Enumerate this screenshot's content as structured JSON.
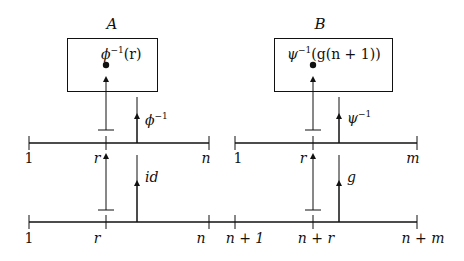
{
  "diagram": {
    "boxes": [
      {
        "id": "A",
        "title": "A",
        "content": "ϕ⁻¹(r)",
        "content_base": "ϕ",
        "content_sup": "−1",
        "content_rest": "(r)"
      },
      {
        "id": "B",
        "title": "B",
        "content": "ψ⁻¹(g(n+1))",
        "content_base": "ψ",
        "content_sup": "−1",
        "content_rest": "(g(n + 1))"
      }
    ],
    "middle_left_line": {
      "ticks": [
        "1",
        "r",
        "n"
      ]
    },
    "middle_right_line": {
      "ticks": [
        "1",
        "r",
        "m"
      ]
    },
    "bottom_line": {
      "ticks": [
        "1",
        "r",
        "n",
        "n + 1",
        "n + r",
        "n + m"
      ]
    },
    "arrows": {
      "phi_inv": {
        "base": "ϕ",
        "sup": "−1"
      },
      "psi_inv": {
        "base": "ψ",
        "sup": "−1"
      },
      "id": "id",
      "g": "g"
    }
  },
  "colors": {
    "stroke": "#111111",
    "background": "#ffffff"
  }
}
